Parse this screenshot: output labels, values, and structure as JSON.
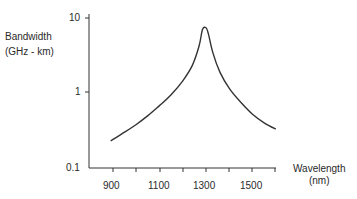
{
  "chart_data": {
    "type": "line",
    "title": "",
    "ylabel": "Bandwidth",
    "ylabel_unit": "(GHz - km)",
    "xlabel": "Wavelength",
    "xlabel_unit": "(nm)",
    "yscale": "log",
    "ylim": [
      0.1,
      10
    ],
    "xlim": [
      800,
      1600
    ],
    "y_ticks": [
      "10",
      "1",
      "0.1"
    ],
    "x_ticks": [
      "900",
      "1100",
      "1300",
      "1500"
    ],
    "x_minor_tick_step": 100,
    "grid": false,
    "legend": null,
    "series": [
      {
        "name": "Bandwidth",
        "x": [
          890,
          950,
          1000,
          1050,
          1100,
          1150,
          1200,
          1240,
          1270,
          1285,
          1300,
          1310,
          1330,
          1360,
          1400,
          1450,
          1500,
          1550,
          1600
        ],
        "values": [
          0.23,
          0.3,
          0.38,
          0.5,
          0.68,
          0.95,
          1.45,
          2.3,
          4.2,
          7.0,
          7.4,
          6.2,
          3.4,
          1.9,
          1.15,
          0.75,
          0.52,
          0.4,
          0.33
        ]
      }
    ]
  }
}
